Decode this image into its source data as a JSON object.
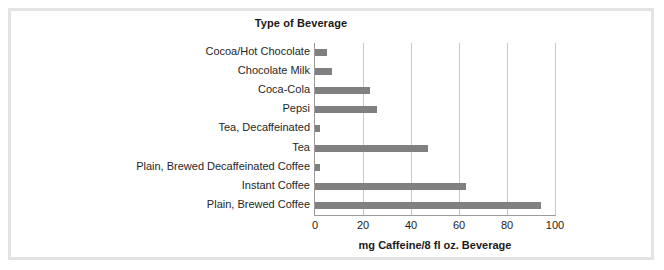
{
  "chart_data": {
    "type": "bar",
    "orientation": "horizontal",
    "title": "Type of Beverage",
    "xlabel": "mg Caffeine/8 fl oz. Beverage",
    "ylabel": "",
    "xlim": [
      0,
      100
    ],
    "xticks": [
      0,
      20,
      40,
      60,
      80,
      100
    ],
    "xtick_labels": [
      "0",
      "20",
      "40",
      "60",
      "80",
      "100"
    ],
    "grid": "vertical",
    "legend": "none",
    "bar_color": "#808080",
    "categories": [
      "Cocoa/Hot Chocolate",
      "Chocolate Milk",
      "Coca-Cola",
      "Pepsi",
      "Tea, Decaffeinated",
      "Tea",
      "Plain, Brewed Decaffeinated Coffee",
      "Instant Coffee",
      "Plain, Brewed Coffee"
    ],
    "values": [
      5,
      7,
      23,
      26,
      2,
      47,
      2,
      63,
      94
    ]
  },
  "colors": {
    "bar": "#808080",
    "gridline": "#c9c9c9",
    "axis": "#9a9a9a",
    "frame": "#e3e3e3",
    "text": "#1a1a1a",
    "background": "#ffffff"
  }
}
